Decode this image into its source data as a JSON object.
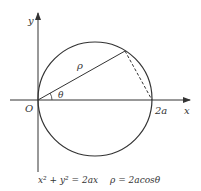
{
  "diagram": {
    "axes": {
      "x_label": "x",
      "y_label": "y",
      "origin_label": "O",
      "x_intercept_label": "2a"
    },
    "labels": {
      "rho": "ρ",
      "theta": "θ"
    },
    "caption": {
      "cartesian": "x² + y² = 2ax",
      "polar": "ρ = 2acosθ"
    },
    "colors": {
      "stroke": "#333333",
      "background": "#ffffff"
    }
  }
}
